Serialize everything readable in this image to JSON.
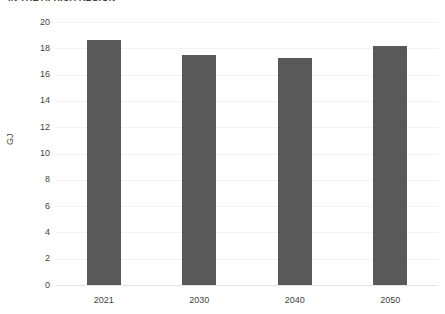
{
  "chart_data": {
    "type": "bar",
    "title": "IN THE AFRICA REGION",
    "xlabel": "",
    "ylabel": "GJ",
    "categories": [
      "2021",
      "2030",
      "2040",
      "2050"
    ],
    "values": [
      18.6,
      17.5,
      17.3,
      18.2
    ],
    "ylim": [
      0,
      20
    ],
    "ytick_labels": [
      "20",
      "18",
      "16",
      "14",
      "12",
      "10",
      "8",
      "6",
      "4",
      "2",
      "0"
    ],
    "ytick_values": [
      20,
      18,
      16,
      14,
      12,
      10,
      8,
      6,
      4,
      2,
      0
    ],
    "grid": true,
    "legend": false,
    "series": [
      {
        "name": "",
        "values": [
          18.6,
          17.5,
          17.3,
          18.2
        ]
      }
    ],
    "colors": {
      "bar": "#595959",
      "gridline": "#f2f2f2",
      "axis_line": "#e2e2e2",
      "text": "#3f3f3f",
      "background": "#ffffff"
    }
  }
}
